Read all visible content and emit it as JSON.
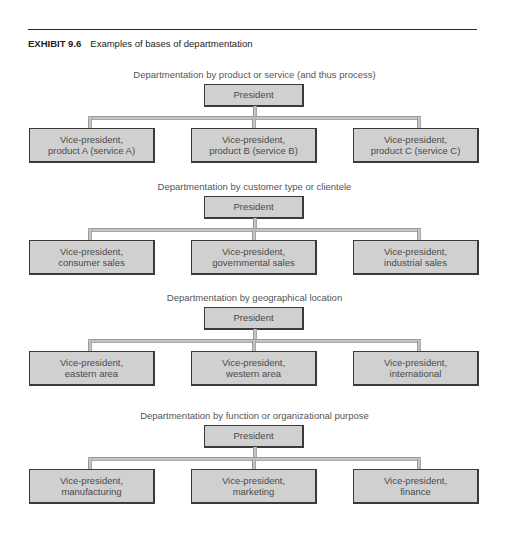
{
  "header": {
    "exhibit_number": "EXHIBIT 9.6",
    "exhibit_title": "Examples of bases of departmentation"
  },
  "charts": [
    {
      "subtitle": "Departmentation by product or service (and thus process)",
      "root": "President",
      "children": [
        {
          "line1": "Vice-president,",
          "line2": "product A (service A)"
        },
        {
          "line1": "Vice-president,",
          "line2": "product B (service B)"
        },
        {
          "line1": "Vice-president,",
          "line2": "product C (service C)"
        }
      ]
    },
    {
      "subtitle": "Departmentation by customer type or clientele",
      "root": "President",
      "children": [
        {
          "line1": "Vice-president,",
          "line2": "consumer sales"
        },
        {
          "line1": "Vice-president,",
          "line2": "governmental sales"
        },
        {
          "line1": "Vice-president,",
          "line2": "industrial sales"
        }
      ]
    },
    {
      "subtitle": "Departmentation by geographical location",
      "root": "President",
      "children": [
        {
          "line1": "Vice-president,",
          "line2": "eastern area"
        },
        {
          "line1": "Vice-president,",
          "line2": "western area"
        },
        {
          "line1": "Vice-president,",
          "line2": "international"
        }
      ]
    },
    {
      "subtitle": "Departmentation by function or organizational purpose",
      "root": "President",
      "children": [
        {
          "line1": "Vice-president,",
          "line2": "manufacturing"
        },
        {
          "line1": "Vice-president,",
          "line2": "marketing"
        },
        {
          "line1": "Vice-president,",
          "line2": "finance"
        }
      ]
    }
  ],
  "colors": {
    "box_fill": "#d0d0d0",
    "box_border": "#3a3a3a",
    "connector": "#c4c4c4",
    "subtitle_text": "#555555"
  }
}
